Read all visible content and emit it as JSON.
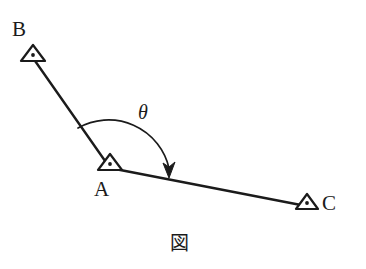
{
  "figure": {
    "caption": "図",
    "background_color": "#ffffff",
    "ink_color": "#1b1b1b",
    "stroke_width_px": 2.2
  },
  "points": [
    {
      "id": "B",
      "label": "B",
      "marker": "triangle-with-dot",
      "x": 33,
      "y": 57,
      "label_x": 12,
      "label_y": 19
    },
    {
      "id": "A",
      "label": "A",
      "marker": "triangle-with-dot",
      "x": 110,
      "y": 166,
      "label_x": 94,
      "label_y": 179
    },
    {
      "id": "C",
      "label": "C",
      "marker": "triangle-with-dot",
      "x": 307,
      "y": 205,
      "label_x": 322,
      "label_y": 193
    }
  ],
  "segments": [
    {
      "id": "BA",
      "from": "B",
      "to": "A",
      "x1": 33,
      "y1": 58,
      "x2": 110,
      "y2": 168
    },
    {
      "id": "AC",
      "from": "A",
      "to": "C",
      "x1": 110,
      "y1": 168,
      "x2": 306,
      "y2": 206
    }
  ],
  "angle": {
    "symbol": "θ",
    "vertex": "A",
    "from_ray": "AB",
    "to_ray": "AC",
    "direction": "clockwise",
    "label_x": 138,
    "label_y": 102,
    "arc_start_x": 78,
    "arc_start_y": 128,
    "arc_end_x": 169,
    "arc_end_y": 176,
    "arrowhead": "down"
  }
}
